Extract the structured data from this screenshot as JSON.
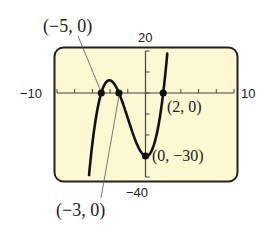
{
  "chart_data": {
    "type": "line",
    "title": "",
    "function": "f(x) = (x+5)(x+3)(x-2)",
    "xlim": [
      -10,
      10
    ],
    "ylim": [
      -40,
      20
    ],
    "xscale_ticks": 2,
    "yscale_ticks": 10,
    "grid": false,
    "axis_labels": {
      "xmin": "−10",
      "xmax": "10",
      "ymax": "20",
      "ymin": "−40"
    },
    "points": [
      {
        "x": -5,
        "y": 0,
        "label": "(−5, 0)"
      },
      {
        "x": -3,
        "y": 0,
        "label": "(−3, 0)"
      },
      {
        "x": 2,
        "y": 0,
        "label": "(2, 0)"
      },
      {
        "x": 0,
        "y": -30,
        "label": "(0, −30)"
      }
    ],
    "colors": {
      "screen_bg": "#fbf8d2",
      "frame": "#222222",
      "curve": "#111111"
    }
  }
}
